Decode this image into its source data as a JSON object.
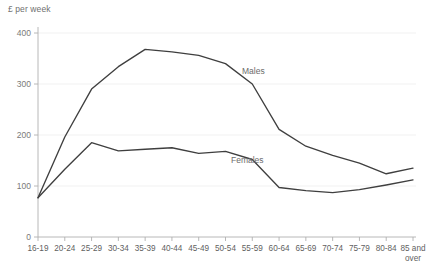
{
  "chart_data": {
    "type": "line",
    "title": "",
    "ylabel": "£ per week",
    "xlabel": "",
    "ylim": [
      0,
      400
    ],
    "yticks": [
      0,
      100,
      200,
      300,
      400
    ],
    "grid": true,
    "legend_position": "inline-annotation",
    "categories": [
      "16-19",
      "20-24",
      "25-29",
      "30-34",
      "35-39",
      "40-44",
      "45-49",
      "50-54",
      "55-59",
      "60-64",
      "65-69",
      "70-74",
      "75-79",
      "80-84",
      "85 and over"
    ],
    "category_last_line1": "85 and",
    "category_last_line2": "over",
    "series": [
      {
        "name": "Males",
        "color": "#3f3f3f",
        "values": [
          77,
          196,
          290,
          334,
          368,
          363,
          356,
          340,
          300,
          211,
          178,
          160,
          145,
          124,
          135
        ]
      },
      {
        "name": "Females",
        "color": "#3f3f3f",
        "values": [
          77,
          133,
          185,
          169,
          172,
          175,
          164,
          168,
          152,
          97,
          91,
          87,
          93,
          102,
          112
        ]
      }
    ],
    "annotations": [
      {
        "text": "Males",
        "series": "Males",
        "x_pixel": 242,
        "y_pixel": 74
      },
      {
        "text": "Females",
        "series": "Females",
        "x_pixel": 231,
        "y_pixel": 163
      }
    ]
  }
}
